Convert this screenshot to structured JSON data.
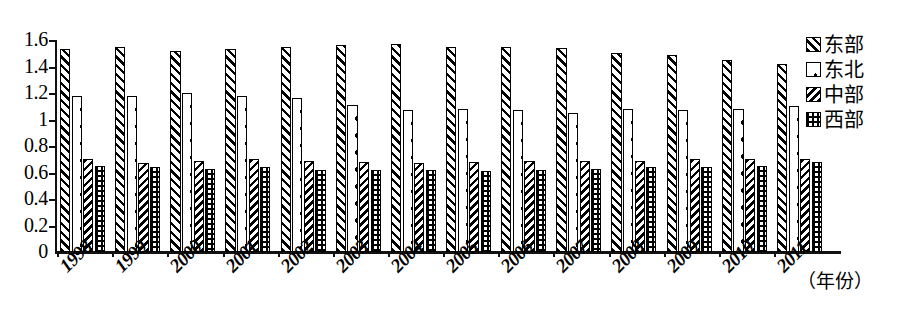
{
  "chart_data": {
    "type": "bar",
    "title": "",
    "subtitle": "",
    "xlabel": "（年份）",
    "ylabel": "",
    "categories": [
      "1998",
      "1999",
      "2000",
      "2001",
      "2002",
      "2003",
      "2004",
      "2005",
      "2006",
      "2007",
      "2008",
      "2009",
      "2010",
      "2011"
    ],
    "ylim": [
      0,
      1.6
    ],
    "yticks": [
      "0",
      "0.2",
      "0.4",
      "0.6",
      "0.8",
      "1",
      "1.2",
      "1.4",
      "1.6"
    ],
    "ytick_values": [
      0,
      0.2,
      0.4,
      0.6,
      0.8,
      1.0,
      1.2,
      1.4,
      1.6
    ],
    "grid": false,
    "legend_position": "right",
    "series": [
      {
        "name": "东部",
        "pattern": "diagonal-stripes",
        "values": [
          1.53,
          1.55,
          1.52,
          1.53,
          1.55,
          1.56,
          1.57,
          1.55,
          1.55,
          1.54,
          1.5,
          1.49,
          1.45,
          1.42
        ]
      },
      {
        "name": "东北",
        "pattern": "sparse-dots",
        "values": [
          1.18,
          1.18,
          1.2,
          1.18,
          1.16,
          1.11,
          1.07,
          1.08,
          1.07,
          1.05,
          1.08,
          1.07,
          1.08,
          1.1
        ]
      },
      {
        "name": "中部",
        "pattern": "dense-back-hatch",
        "values": [
          0.7,
          0.67,
          0.69,
          0.7,
          0.69,
          0.68,
          0.67,
          0.68,
          0.69,
          0.69,
          0.69,
          0.7,
          0.7,
          0.7
        ]
      },
      {
        "name": "西部",
        "pattern": "checker-grid",
        "values": [
          0.65,
          0.64,
          0.63,
          0.64,
          0.62,
          0.62,
          0.62,
          0.61,
          0.62,
          0.63,
          0.64,
          0.64,
          0.65,
          0.68
        ]
      }
    ]
  },
  "legend": {
    "items": [
      {
        "label": "东部"
      },
      {
        "label": "东北"
      },
      {
        "label": "中部"
      },
      {
        "label": "西部"
      }
    ]
  }
}
